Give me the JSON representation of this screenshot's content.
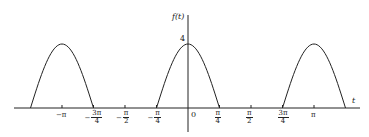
{
  "chart_data": {
    "type": "line",
    "title": "",
    "xlabel": "t",
    "ylabel": "f(t)",
    "x_ticks": [
      "-π",
      "-3π/4",
      "-π/2",
      "-π/4",
      "0",
      "π/4",
      "π/2",
      "3π/4",
      "π"
    ],
    "x_tick_values": [
      -3.1416,
      -2.3562,
      -1.5708,
      -0.7854,
      0,
      0.7854,
      1.5708,
      2.3562,
      3.1416
    ],
    "y_ticks": [
      "4"
    ],
    "y_tick_values": [
      4
    ],
    "xlim": [
      -4.1,
      4.4
    ],
    "ylim": [
      0,
      4.5
    ],
    "grid": false,
    "legend": null,
    "series": [
      {
        "name": "f(t)",
        "pulses": [
          {
            "start": -3.927,
            "end": -2.3562,
            "peak_t": -3.1416,
            "peak_value": 4
          },
          {
            "start": -0.7854,
            "end": 0.7854,
            "peak_t": 0,
            "peak_value": 4
          },
          {
            "start": 2.3562,
            "end": 3.927,
            "peak_t": 3.1416,
            "peak_value": 4
          }
        ],
        "x": [
          -3.927,
          -3.534,
          -3.1416,
          -2.749,
          -2.3562,
          -0.7854,
          -0.3927,
          0,
          0.3927,
          0.7854,
          2.3562,
          2.749,
          3.1416,
          3.534,
          3.927
        ],
        "y": [
          0,
          2.83,
          4,
          2.83,
          0,
          0,
          2.83,
          4,
          2.83,
          0,
          0,
          2.83,
          4,
          2.83,
          0
        ]
      }
    ]
  },
  "labels": {
    "y_axis": "f(t)",
    "x_axis": "t",
    "y_tick_4": "4",
    "origin": "0",
    "x_ticks": [
      {
        "num": "−π",
        "den": ""
      },
      {
        "num": "3π",
        "den": "4",
        "neg": true
      },
      {
        "num": "π",
        "den": "2",
        "neg": true
      },
      {
        "num": "π",
        "den": "4",
        "neg": true
      },
      {
        "num": "π",
        "den": "4"
      },
      {
        "num": "π",
        "den": "2"
      },
      {
        "num": "3π",
        "den": "4"
      },
      {
        "num": "π",
        "den": ""
      }
    ]
  }
}
